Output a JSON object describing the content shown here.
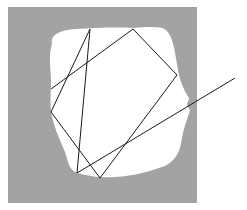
{
  "canvas": {
    "width": 247,
    "height": 210,
    "background": "#ffffff"
  },
  "frame": {
    "x": 8,
    "y": 7,
    "width": 189,
    "height": 196,
    "fill": "#a3a3a3"
  },
  "region": {
    "fill": "#ffffff",
    "path": "M 52 44 C 50 34, 62 30, 75 29 C 95 28, 115 27, 133 28 C 150 27, 160 26, 166 30 C 173 36, 175 52, 178 70 C 180 82, 185 92, 189 98 L 188 102 C 186 104, 188 107, 190 110 C 188 118, 184 126, 182 138 C 180 152, 176 160, 165 166 C 150 171, 135 176, 115 177 C 100 178, 85 176, 75 172 C 68 168, 68 160, 65 152 C 60 140, 54 128, 51 112 C 50 100, 51 90, 51 82 C 51 68, 48 56, 52 44 Z"
  },
  "ray": {
    "stroke": "#1a1a1a",
    "stroke_width": 1,
    "points": [
      [
        235,
        78
      ],
      [
        77,
        173
      ],
      [
        90,
        29
      ],
      [
        51,
        112
      ],
      [
        100,
        178
      ],
      [
        177,
        75
      ],
      [
        133,
        29
      ],
      [
        51,
        89
      ]
    ]
  }
}
